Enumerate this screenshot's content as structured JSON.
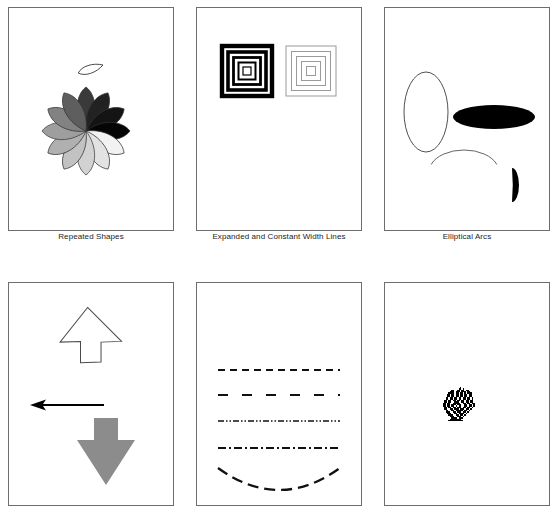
{
  "figure": {
    "title": "",
    "width": 557,
    "height": 518,
    "background": "#ffffff",
    "frame_color": "#6e6e6e",
    "rows": 2,
    "columns": 3
  },
  "panels": [
    {
      "id": "repeated-shapes",
      "caption": "Repeated Shapes",
      "content_type": "repeated-petal-rosette",
      "description": "A single teardrop petal outline above a rosette of twelve filled teardrop petals arranged radially with a grayscale gradient",
      "sample_shape": {
        "name": "teardrop-outline",
        "fill": "#ffffff",
        "stroke": "#333333",
        "center_x": 95,
        "center_y": 58,
        "width": 26,
        "height": 11
      },
      "rosette": {
        "center_x": 78,
        "center_y": 124,
        "petal_count": 12,
        "petal_length": 44,
        "petal_width": 23,
        "stroke": "#333333",
        "start_angle_deg": -90,
        "petal_fills": [
          "#3a3a3a",
          "#222222",
          "#141414",
          "#050505",
          "#f2f2f2",
          "#e2e2e2",
          "#d2d2d2",
          "#c2c2c2",
          "#b0b0b0",
          "#9e9e9e",
          "#828282",
          "#5e5e5e"
        ]
      }
    },
    {
      "id": "width-lines",
      "caption": "Expanded and Constant Width Lines",
      "content_type": "nested-squares",
      "description": "Two sets of concentric squares: the left uses expanding (progressively thicker) black strokes, the right uses constant thin gray strokes",
      "groups": [
        {
          "name": "expanded-width-squares",
          "label": "Expanded Width",
          "center_x": 51,
          "center_y": 64,
          "stroke": "#000000",
          "rings": [
            {
              "size": 8,
              "stroke_width": 1.2
            },
            {
              "size": 17,
              "stroke_width": 2.0
            },
            {
              "size": 27,
              "stroke_width": 2.8
            },
            {
              "size": 38,
              "stroke_width": 3.6
            },
            {
              "size": 50,
              "stroke_width": 4.4
            }
          ]
        },
        {
          "name": "constant-width-squares",
          "label": "Constant Width",
          "center_x": 115,
          "center_y": 64,
          "stroke": "#9a9a9a",
          "rings": [
            {
              "size": 9,
              "stroke_width": 1
            },
            {
              "size": 19,
              "stroke_width": 1
            },
            {
              "size": 29,
              "stroke_width": 1
            },
            {
              "size": 39,
              "stroke_width": 1
            },
            {
              "size": 50,
              "stroke_width": 1
            }
          ]
        }
      ]
    },
    {
      "id": "elliptical-arcs",
      "caption": "Elliptical Arcs",
      "content_type": "ellipses-and-arcs",
      "description": "An outlined vertical ellipse, a solid black horizontal ellipse, a thin open arc, and a filled black half-ellipse lune",
      "shapes": [
        {
          "name": "outlined-vertical-ellipse",
          "kind": "ellipse",
          "cx": 42,
          "cy": 105,
          "rx": 22,
          "ry": 40,
          "fill": "none",
          "stroke": "#3c3c3c",
          "stroke_width": 0.9
        },
        {
          "name": "filled-horizontal-ellipse",
          "kind": "ellipse",
          "cx": 110,
          "cy": 110,
          "rx": 41,
          "ry": 12,
          "fill": "#000000",
          "stroke": "none",
          "stroke_width": 0
        },
        {
          "name": "open-arc",
          "kind": "arc",
          "cx": 80,
          "cy": 165,
          "rx": 35,
          "ry": 22,
          "fill": "none",
          "stroke": "#555555",
          "stroke_width": 0.9,
          "start_angle_deg": 200,
          "end_angle_deg": 340
        },
        {
          "name": "filled-half-ellipse",
          "kind": "lune",
          "cx": 128,
          "cy": 178,
          "rx": 7,
          "ry": 17,
          "fill": "#000000",
          "stroke": "none",
          "stroke_width": 0
        }
      ]
    },
    {
      "id": "arrows",
      "caption": "",
      "content_type": "arrow-shapes",
      "description": "An outlined diagonal arrow pointing up-right, a solid black arrow pointing left, and a gray block arrow pointing down",
      "shapes": [
        {
          "name": "diagonal-arrow-outline",
          "direction": "up-right",
          "fill": "#ffffff",
          "stroke": "#4a4a4a",
          "stroke_width": 1
        },
        {
          "name": "left-arrow-solid",
          "direction": "left",
          "fill": "#000000",
          "stroke": "#000000",
          "stroke_width": 1,
          "shaft_y": 123,
          "tip_x": 22,
          "tail_x": 96
        },
        {
          "name": "down-arrow-gray",
          "direction": "down",
          "fill": "#8c8c8c",
          "stroke": "none",
          "stroke_width": 0
        }
      ]
    },
    {
      "id": "dash-patterns",
      "caption": "",
      "content_type": "dash-pattern-lines",
      "description": "Five horizontal specimens demonstrating dash patterns; the last is drawn along a downward-bowed arc",
      "lines": [
        {
          "name": "dashed-line",
          "pattern_label": "dash",
          "dash_array": "7,5",
          "stroke": "#101010",
          "stroke_width": 2.1,
          "y": 88,
          "x_start": 22,
          "x_end": 144,
          "shape": "straight"
        },
        {
          "name": "long-dash-line",
          "pattern_label": "long dash",
          "dash_array": "10,14",
          "stroke": "#101010",
          "stroke_width": 2.2,
          "y": 113,
          "x_start": 22,
          "x_end": 144,
          "shape": "straight"
        },
        {
          "name": "dash-dot-dot-line",
          "pattern_label": "dash dot dot",
          "dash_array": "6,2,1.5,2,1.5,2",
          "stroke": "#101010",
          "stroke_width": 1.7,
          "y": 139,
          "x_start": 22,
          "x_end": 144,
          "shape": "straight"
        },
        {
          "name": "dash-dot-line",
          "pattern_label": "dash dot",
          "dash_array": "8,3,2,3",
          "stroke": "#101010",
          "stroke_width": 1.9,
          "y": 166,
          "x_start": 22,
          "x_end": 144,
          "shape": "straight"
        },
        {
          "name": "dashed-arc",
          "pattern_label": "dash on arc",
          "dash_array": "11,6",
          "stroke": "#101010",
          "stroke_width": 2.3,
          "y": 186,
          "x_start": 22,
          "x_end": 144,
          "shape": "arc",
          "arc_sag": 22
        }
      ]
    },
    {
      "id": "bitmap",
      "caption": "",
      "content_type": "bitmap-image",
      "description": "A small low-resolution black-and-white bitmap of a turkey",
      "image": {
        "name": "turkey-bitmap",
        "center_x": 76,
        "center_y": 122,
        "pixel_size": 1.45,
        "grid_width": 26,
        "grid_height": 26,
        "ink": "#000000",
        "rows": [
          "00000000000000000000000000",
          "00000000000001000000000000",
          "00000000000011010000000000",
          "00000001100110110110000000",
          "00000011101110111011000000",
          "00000111101101101011100000",
          "00001101101101101101100000",
          "00001101101101101101100000",
          "00011011011011011011010000",
          "00011011011011011011010000",
          "00110110110110110110110000",
          "00110110011100110110110000",
          "01101100111110011011011000",
          "01101101110111001101101000",
          "01101101101011001101101000",
          "00110110110111011011010000",
          "00110011011101110110100000",
          "00011001101111101101000000",
          "00011100110111011010000000",
          "00001110011011110100000000",
          "00000111001101101000000000",
          "00000011100111010000000000",
          "00000001111011100000000000",
          "00000011111111000000000000",
          "00000111111111100000000000",
          "00000000000000000000000000"
        ]
      }
    }
  ]
}
